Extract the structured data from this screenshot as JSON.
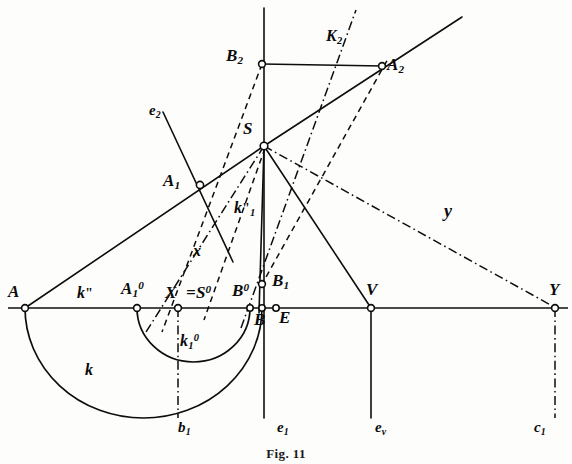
{
  "figure": {
    "domain": "diagram",
    "kind": "descriptive-geometry construction",
    "caption": "Fig. 11",
    "background_color": "#fdfdfc",
    "ink_color": "#0d0d0d",
    "width": 572,
    "height": 464
  },
  "points": [
    {
      "id": "A",
      "label": "A",
      "x": 25,
      "y": 308,
      "label_x": 10,
      "label_y": 286
    },
    {
      "id": "A1o",
      "label": "A",
      "sub": "1",
      "sup": "0",
      "x": 137,
      "y": 308,
      "label_x": 123,
      "label_y": 283
    },
    {
      "id": "X",
      "label": "X",
      "x": 178,
      "y": 308,
      "label_x": 166,
      "label_y": 287
    },
    {
      "id": "Bo",
      "label": "B",
      "sup": "0",
      "x": 250,
      "y": 308,
      "label_x": 234,
      "label_y": 285
    },
    {
      "id": "B",
      "label": "B",
      "x": 262,
      "y": 308,
      "label_x": 256,
      "label_y": 313
    },
    {
      "id": "E",
      "label": "E",
      "x": 276,
      "y": 308,
      "label_x": 280,
      "label_y": 311
    },
    {
      "id": "V",
      "label": "V",
      "x": 371,
      "y": 308,
      "label_x": 368,
      "label_y": 283
    },
    {
      "id": "Y",
      "label": "Y",
      "x": 555,
      "y": 308,
      "label_x": 551,
      "label_y": 283
    },
    {
      "id": "B1",
      "label": "B",
      "sub": "1",
      "x": 262,
      "y": 284,
      "label_x": 274,
      "label_y": 276
    },
    {
      "id": "A1",
      "label": "A",
      "sub": "1",
      "x": 200,
      "y": 185,
      "label_x": 166,
      "label_y": 174
    },
    {
      "id": "S",
      "label": "S",
      "x": 264,
      "y": 146,
      "label_x": 246,
      "label_y": 123
    },
    {
      "id": "B2",
      "label": "B",
      "sub": "2",
      "x": 262,
      "y": 64,
      "label_x": 228,
      "label_y": 50
    },
    {
      "id": "A2",
      "label": "A",
      "sub": "2",
      "x": 382,
      "y": 66,
      "label_x": 388,
      "label_y": 59
    }
  ],
  "curve_labels": [
    {
      "id": "k",
      "label": "k",
      "x": 88,
      "y": 370,
      "note": "large semicircle over AB"
    },
    {
      "id": "k1o",
      "label": "k",
      "sub": "1",
      "sup": "0",
      "x": 183,
      "y": 340,
      "note": "small semicircle"
    },
    {
      "id": "kpp",
      "label": "k",
      "prime": "\"",
      "x": 80,
      "y": 289,
      "note": "baseline segment label"
    },
    {
      "id": "k1pp",
      "label": "k",
      "sub": "1",
      "prime": "\"",
      "x": 238,
      "y": 207,
      "note": "line S to B"
    },
    {
      "id": "K2",
      "label": "K",
      "sub": "2",
      "x": 330,
      "y": 33,
      "note": "segment B2 to A2"
    }
  ],
  "line_labels": [
    {
      "id": "e2",
      "label": "e",
      "sub": "2",
      "x": 152,
      "y": 107
    },
    {
      "id": "e1",
      "label": "e",
      "sub": "1",
      "x": 281,
      "y": 424
    },
    {
      "id": "ev",
      "label": "e",
      "sub": "v",
      "x": 379,
      "y": 424
    },
    {
      "id": "c1",
      "label": "c",
      "sub": "1",
      "x": 538,
      "y": 424
    },
    {
      "id": "b1",
      "label": "b",
      "sub": "1",
      "x": 182,
      "y": 424
    },
    {
      "id": "x",
      "label": "x",
      "x": 196,
      "y": 249
    },
    {
      "id": "y",
      "label": "y",
      "x": 448,
      "y": 209
    },
    {
      "id": "Seq",
      "label": "=S",
      "sup": "0",
      "x": 192,
      "y": 287
    }
  ],
  "segments": [
    {
      "id": "baseline",
      "style": "solid",
      "from": [
        8,
        308
      ],
      "to": [
        568,
        308
      ]
    },
    {
      "id": "A-to-A1-S",
      "style": "solid",
      "from": [
        25,
        308
      ],
      "to": [
        264,
        146
      ]
    },
    {
      "id": "S-to-A2-ray",
      "style": "solid",
      "from": [
        264,
        146
      ],
      "to": [
        462,
        17
      ]
    },
    {
      "id": "S-to-B",
      "style": "solid",
      "from": [
        264,
        146
      ],
      "to": [
        262,
        308
      ]
    },
    {
      "id": "S-to-Bsolid",
      "style": "solid",
      "from": [
        264,
        146
      ],
      "to": [
        259,
        312
      ]
    },
    {
      "id": "S-to-V",
      "style": "solid",
      "from": [
        264,
        146
      ],
      "to": [
        371,
        308
      ]
    },
    {
      "id": "vertical-e1",
      "style": "solid",
      "from": [
        264,
        8
      ],
      "to": [
        264,
        418
      ]
    },
    {
      "id": "B2-A2",
      "style": "solid",
      "from": [
        262,
        64
      ],
      "to": [
        382,
        66
      ]
    },
    {
      "id": "e2-line",
      "style": "solid",
      "from": [
        163,
        112
      ],
      "to": [
        232,
        260
      ]
    },
    {
      "id": "V-ev",
      "style": "solid",
      "from": [
        371,
        308
      ],
      "to": [
        371,
        418
      ]
    },
    {
      "id": "dash-B2-down",
      "style": "dashed",
      "from": [
        262,
        64
      ],
      "to": [
        163,
        330
      ]
    },
    {
      "id": "dash-B1-A2",
      "style": "dashed",
      "from": [
        262,
        284
      ],
      "to": [
        388,
        58
      ]
    },
    {
      "id": "dash-S-left",
      "style": "dashed",
      "from": [
        264,
        146
      ],
      "to": [
        205,
        318
      ]
    },
    {
      "id": "dashdot-x",
      "style": "dashdot",
      "from": [
        264,
        146
      ],
      "to": [
        148,
        330
      ]
    },
    {
      "id": "dashdot-y",
      "style": "dashdot",
      "from": [
        264,
        146
      ],
      "to": [
        556,
        308
      ]
    },
    {
      "id": "dashdot-up",
      "style": "dashdot",
      "from": [
        243,
        326
      ],
      "to": [
        355,
        10
      ]
    },
    {
      "id": "dashdot-b1",
      "style": "dashdot",
      "from": [
        178,
        308
      ],
      "to": [
        178,
        418
      ]
    },
    {
      "id": "dashdot-c1",
      "style": "dashdot",
      "from": [
        555,
        308
      ],
      "to": [
        555,
        418
      ]
    }
  ],
  "arcs": [
    {
      "id": "arc-k",
      "style": "solid",
      "cx": 143.5,
      "cy": 308,
      "rx": 118.5,
      "ry": 110,
      "note": "semicircle A to B below baseline"
    },
    {
      "id": "arc-k1o",
      "style": "solid",
      "cx": 193.5,
      "cy": 308,
      "rx": 56.5,
      "ry": 54,
      "note": "semicircle A1o to Bo below baseline"
    }
  ]
}
